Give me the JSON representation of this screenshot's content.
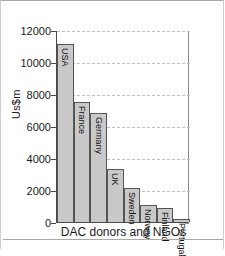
{
  "chart_data": {
    "type": "bar",
    "title": "",
    "subtitle": "",
    "xlabel": "DAC donors and NGOs",
    "ylabel": "Us$m",
    "categories": [
      "USA",
      "France",
      "Germany",
      "UK",
      "Sweden",
      "Norway",
      "Finland",
      "Portugal"
    ],
    "values": [
      11100,
      7500,
      6800,
      3300,
      2100,
      1050,
      900,
      200
    ],
    "ylim": [
      0,
      12000
    ],
    "yticks": [
      0,
      2000,
      4000,
      6000,
      8000,
      10000,
      12000
    ],
    "ytick_labels": [
      "0",
      "2000",
      "4000",
      "6000",
      "8000",
      "10000",
      "12000"
    ],
    "grid": true,
    "grid_style": "dashed",
    "legend": "none",
    "bar_fill": "#c9c9c9",
    "bar_edge": "#555555",
    "axis_color": "#4a4a4a",
    "grid_color": "#c0c0c0",
    "label_rotation": 90,
    "labels_inside_bars": true
  },
  "figure": {
    "background": "#ffffff",
    "border_color": "#a9a9a9"
  }
}
